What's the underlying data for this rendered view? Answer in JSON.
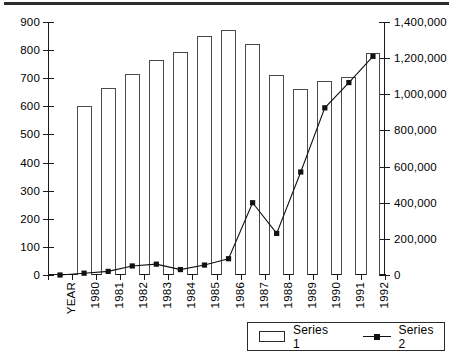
{
  "chart_data": {
    "type": "bar",
    "title": "",
    "subtitle": "",
    "xlabel": "",
    "ylabel": "",
    "grid": false,
    "legend_position": "bottom-right",
    "categories": [
      "YEAR",
      "1980",
      "1981",
      "1982",
      "1983",
      "1984",
      "1985",
      "1986",
      "1987",
      "1988",
      "1989",
      "1990",
      "1991",
      "1992"
    ],
    "left_axis": {
      "label": "",
      "ylim": [
        0,
        900
      ],
      "tick_step": 100,
      "ticks": [
        0,
        100,
        200,
        300,
        400,
        500,
        600,
        700,
        800,
        900
      ],
      "tick_labels": [
        "0",
        "100",
        "200",
        "300",
        "400",
        "500",
        "600",
        "700",
        "800",
        "900"
      ]
    },
    "right_axis": {
      "label": "",
      "ylim": [
        0,
        1400000
      ],
      "tick_step": 200000,
      "ticks": [
        0,
        200000,
        400000,
        600000,
        800000,
        1000000,
        1200000,
        1400000
      ],
      "tick_labels": [
        "0",
        "200,000",
        "400,000",
        "600,000",
        "800,000",
        "1,000,000",
        "1,200,000",
        "1,400,000"
      ]
    },
    "series": [
      {
        "name": "Series 1",
        "type": "bar",
        "axis": "left",
        "values": [
          null,
          600,
          665,
          715,
          765,
          795,
          850,
          870,
          820,
          710,
          660,
          690,
          705,
          790
        ]
      },
      {
        "name": "Series 2",
        "type": "line",
        "axis": "right",
        "marker": "square",
        "values": [
          0,
          10000,
          20000,
          50000,
          60000,
          30000,
          55000,
          90000,
          400000,
          230000,
          570000,
          925000,
          1065000,
          1210000
        ]
      }
    ]
  },
  "legend": {
    "items": [
      {
        "label": "Series 1",
        "marker": "bar-swatch"
      },
      {
        "label": "Series 2",
        "marker": "line-square-swatch"
      }
    ]
  }
}
